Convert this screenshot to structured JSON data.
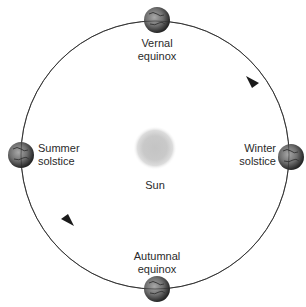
{
  "diagram": {
    "orbit": {
      "center": [
        155,
        155
      ],
      "radius": 134,
      "stroke": "#3a3a3a",
      "direction": "counterclockwise"
    },
    "sun": {
      "label": "Sun",
      "center": [
        155,
        148
      ],
      "radius": 17,
      "color": "#b8b8b8"
    },
    "positions": [
      {
        "id": "vernal",
        "line1": "Vernal",
        "line2": "equinox",
        "earth": [
          157,
          20
        ]
      },
      {
        "id": "summer",
        "line1": "Summer",
        "line2": "solstice",
        "earth": [
          21,
          155
        ]
      },
      {
        "id": "winter",
        "line1": "Winter",
        "line2": "solstice",
        "earth": [
          291,
          157
        ]
      },
      {
        "id": "autumnal",
        "line1": "Autumnal",
        "line2": "equinox",
        "earth": [
          157,
          289
        ]
      }
    ],
    "arrows": [
      {
        "id": "arrow-upper-right",
        "at": [
          253,
          83
        ],
        "direction": "up-left"
      },
      {
        "id": "arrow-lower-left",
        "at": [
          67,
          219
        ],
        "direction": "down-right"
      }
    ],
    "earth_style": {
      "radius": 13,
      "light": "#9a9a9a",
      "dark": "#2e2e2e"
    }
  }
}
